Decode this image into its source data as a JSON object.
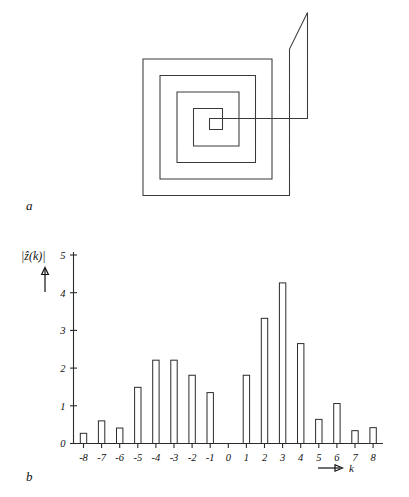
{
  "figure": {
    "panels": [
      {
        "id": "a",
        "label": "a",
        "kind": "spiral-contour-drawing"
      },
      {
        "id": "b",
        "label": "b",
        "kind": "bar-chart"
      }
    ]
  },
  "panel_a": {
    "label": "a",
    "description": "square-spiral closed contour outline",
    "stroke_color": "#3a3a3a"
  },
  "panel_b": {
    "label": "b",
    "axis_arrow_label": "k",
    "y_axis_label": "|ẑ(k)|"
  },
  "chart_data": {
    "type": "bar",
    "title": "",
    "xlabel": "k",
    "ylabel": "|ẑ(k)|",
    "categories": [
      "-8",
      "-7",
      "-6",
      "-5",
      "-4",
      "-3",
      "-2",
      "-1",
      "0",
      "1",
      "2",
      "3",
      "4",
      "5",
      "6",
      "7",
      "8"
    ],
    "x": [
      -8,
      -7,
      -6,
      -5,
      -4,
      -3,
      -2,
      -1,
      0,
      1,
      2,
      3,
      4,
      5,
      6,
      7,
      8
    ],
    "values": [
      0.27,
      0.6,
      0.41,
      1.49,
      2.21,
      2.21,
      1.81,
      1.35,
      0.0,
      1.81,
      3.32,
      4.26,
      2.65,
      0.64,
      1.06,
      0.34,
      0.42
    ],
    "ylim": [
      0,
      5
    ],
    "yticks": [
      0,
      1,
      2,
      3,
      4,
      5
    ],
    "ytick_labels": [
      "0",
      "1",
      "2",
      "3",
      "4",
      "5"
    ],
    "xtick_labels": [
      "-8",
      "-7",
      "-6",
      "-5",
      "-4",
      "-3",
      "-2",
      "-1",
      "0",
      "1",
      "2",
      "3",
      "4",
      "5",
      "6",
      "7",
      "8"
    ],
    "grid": false,
    "legend": null,
    "bar_fill": "#ffffff",
    "bar_stroke": "#2b2b2b"
  }
}
